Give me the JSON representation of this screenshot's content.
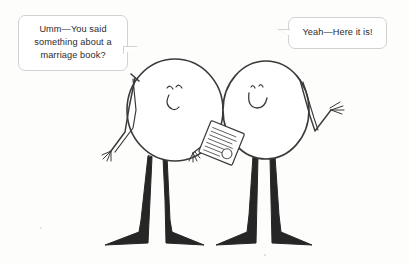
{
  "scene": {
    "title": "Two stick figures talking about a marriage book",
    "background_color": "#fdfdfc",
    "ink_color": "#3a3a3a",
    "fill_color": "#ffffff"
  },
  "bubbles": {
    "left": {
      "speaker": "left-figure",
      "text": "Umm—You said something about a marriage book?",
      "border_color": "#d2d2d2",
      "background_color": "#ffffff",
      "text_color": "#2b2b2b",
      "tail_direction": "bottom-right"
    },
    "right": {
      "speaker": "right-figure",
      "text": "Yeah—Here it is!",
      "border_color": "#d2d2d2",
      "background_color": "#ffffff",
      "text_color": "#2b2b2b",
      "tail_direction": "bottom-left"
    }
  },
  "figures": {
    "left": {
      "name": "left-stick-figure",
      "head_shape": "oval",
      "face": "two-dot-eyes-and-smile",
      "face_side": "right",
      "left_arm": "crossed-down-with-fingers",
      "right_arm": "down-with-fingers",
      "legs": 2,
      "feet": "splayed-outward"
    },
    "right": {
      "name": "right-stick-figure",
      "head_shape": "oval",
      "face": "two-dot-eyes-and-smile",
      "face_side": "left",
      "left_arm": "holding-book",
      "right_arm": "raised-with-spread-fingers",
      "legs": 2,
      "feet": "splayed-outward"
    }
  },
  "props": {
    "book": {
      "name": "marriage-book",
      "description": "tilted rectangular book with scribbled text lines and a small circle",
      "held_by": "right-figure"
    }
  }
}
